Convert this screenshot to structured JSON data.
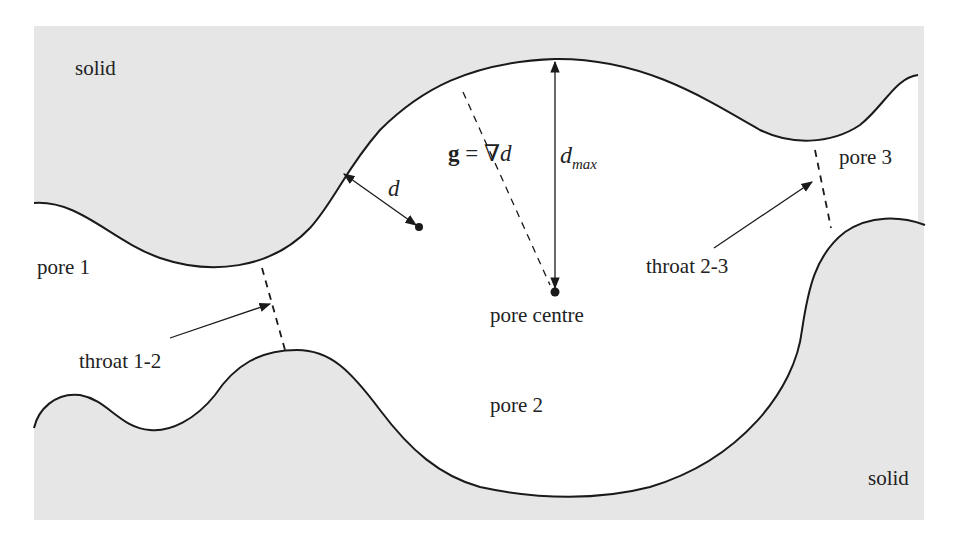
{
  "diagram": {
    "colors": {
      "solid_fill": "#e6e6e6",
      "pore_fill": "#ffffff",
      "boundary_stroke": "#1a1a1a",
      "text": "#222222"
    },
    "labels": {
      "solid_top": "solid",
      "solid_bottom": "solid",
      "pore_1": "pore 1",
      "pore_2": "pore 2",
      "pore_3": "pore 3",
      "pore_centre": "pore centre",
      "throat_12": "throat 1-2",
      "throat_23": "throat 2-3",
      "distance": "d",
      "gradient_g": "g",
      "gradient_eq": " = ∇",
      "gradient_d": "d",
      "dmax_d": "d",
      "dmax_sub": "max"
    },
    "annotations": [
      {
        "id": "distance-arrow",
        "type": "double-arrow",
        "meaning": "distance d from wall to point"
      },
      {
        "id": "gradient-line",
        "type": "dashed-line",
        "meaning": "g = ∇d gradient path to pore centre"
      },
      {
        "id": "dmax-arrow",
        "type": "double-arrow",
        "meaning": "d_max maximal distance at pore centre"
      },
      {
        "id": "throat-12-line",
        "type": "dashed-line",
        "meaning": "throat between pore 1 and pore 2"
      },
      {
        "id": "throat-23-line",
        "type": "dashed-line",
        "meaning": "throat between pore 2 and pore 3"
      }
    ]
  }
}
